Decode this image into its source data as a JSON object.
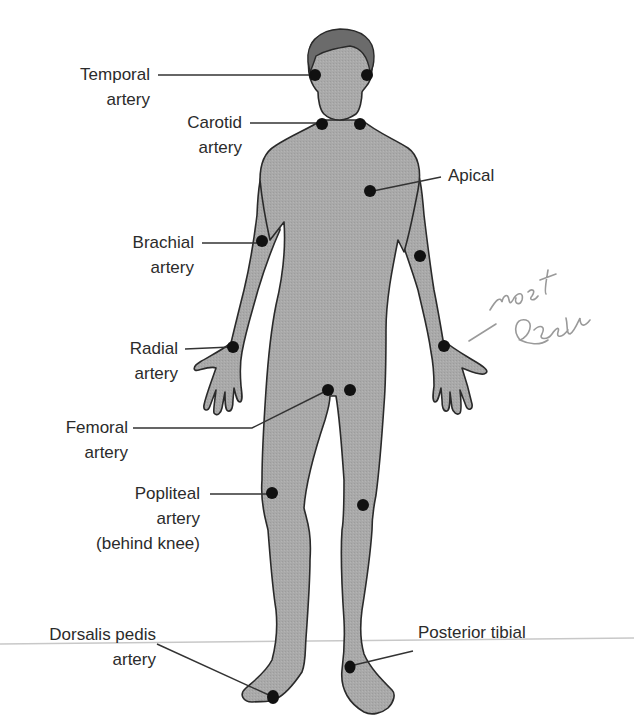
{
  "diagram": {
    "colors": {
      "background": "#ffffff",
      "body_fill": "#a9a9a9",
      "body_outline": "#2a2a2a",
      "hair": "#6b6b6b",
      "pulse_dot": "#111111",
      "label_text": "#2b2b2b",
      "leader_line": "#333333",
      "handwriting": "#9a9a9a",
      "scan_line": "#c8c8c8"
    },
    "labels": [
      {
        "id": "temporal",
        "lines": [
          "Temporal",
          "artery"
        ]
      },
      {
        "id": "carotid",
        "lines": [
          "Carotid",
          "artery"
        ]
      },
      {
        "id": "apical",
        "lines": [
          "Apical"
        ]
      },
      {
        "id": "brachial",
        "lines": [
          "Brachial",
          "artery"
        ]
      },
      {
        "id": "radial",
        "lines": [
          "Radial",
          "artery"
        ]
      },
      {
        "id": "femoral",
        "lines": [
          "Femoral",
          "artery"
        ]
      },
      {
        "id": "popliteal",
        "lines": [
          "Popliteal",
          "artery",
          "(behind knee)"
        ]
      },
      {
        "id": "dorsalis_pedis",
        "lines": [
          "Dorsalis pedis",
          "artery"
        ]
      },
      {
        "id": "posterior_tibial",
        "lines": [
          "Posterior tibial"
        ]
      }
    ],
    "handwritten_annotation": {
      "lines": [
        "most",
        "reliable"
      ],
      "points_to": "radial"
    },
    "pulse_points": [
      {
        "site": "temporal-left",
        "x": 315,
        "y": 75
      },
      {
        "site": "temporal-right",
        "x": 367,
        "y": 75
      },
      {
        "site": "carotid-left",
        "x": 322,
        "y": 124
      },
      {
        "site": "carotid-right",
        "x": 360,
        "y": 124
      },
      {
        "site": "apical",
        "x": 370,
        "y": 191
      },
      {
        "site": "brachial-left",
        "x": 262,
        "y": 241
      },
      {
        "site": "brachial-right",
        "x": 420,
        "y": 256
      },
      {
        "site": "radial-left",
        "x": 233,
        "y": 347
      },
      {
        "site": "radial-right",
        "x": 444,
        "y": 346
      },
      {
        "site": "femoral-left",
        "x": 328,
        "y": 390
      },
      {
        "site": "femoral-right",
        "x": 350,
        "y": 390
      },
      {
        "site": "popliteal-left",
        "x": 272,
        "y": 493
      },
      {
        "site": "popliteal-right",
        "x": 363,
        "y": 505
      },
      {
        "site": "dorsalis-pedis",
        "x": 273,
        "y": 697
      },
      {
        "site": "posterior-tibial",
        "x": 348,
        "y": 667
      }
    ]
  }
}
